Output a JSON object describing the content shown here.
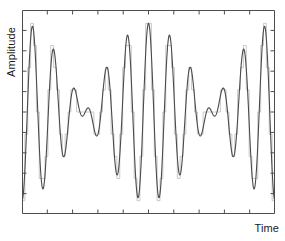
{
  "figure": {
    "background_color": "#ffffff",
    "width": 285,
    "height": 241
  },
  "axes": {
    "ylabel_text": "Amplitude",
    "xlabel_text": "Time",
    "frame_color": "#4d4d4d",
    "tick_color": "#4d4d4d",
    "x_tick_count": 9,
    "y_tick_count": 9,
    "tick_direction": "in",
    "tick_labels_visible": false,
    "grid": false
  },
  "series_style": {
    "analog_color": "#4a4a4a",
    "analog_width": 1.1,
    "quantized_color": "#c8c8c8",
    "quantized_width": 1.0
  },
  "chart_data": {
    "type": "line",
    "title": "",
    "xlabel": "Time",
    "ylabel": "Amplitude",
    "xlim": [
      0,
      1
    ],
    "ylim": [
      -1.15,
      1.15
    ],
    "grid": false,
    "legend_position": "none",
    "tick_labels": {
      "x": [],
      "y": []
    },
    "signal_model": {
      "formula": "y(t) = 0.5*sin(2*pi*f1*t) + 0.5*sin(2*pi*f2*t)",
      "f1_cycles_over_span": 13,
      "f2_cycles_over_span": 11,
      "phase1_deg": -90,
      "phase2_deg": -90,
      "amplitude1": 0.5,
      "amplitude2": 0.5
    },
    "sampling": {
      "sample_count": 88,
      "quantization_levels": 9,
      "quantization_step": 0.25,
      "hold": "zero-order"
    },
    "series": [
      {
        "name": "analog",
        "kind": "smooth",
        "color": "#4a4a4a",
        "points_hint": "evaluated from signal_model at 1400 samples"
      },
      {
        "name": "quantized",
        "kind": "staircase",
        "color": "#c8c8c8",
        "points_hint": "signal_model sampled at sampling.sample_count, rounded to quantization_step, zero-order hold"
      }
    ],
    "envelope_peaks_y": [
      1.0,
      0.55,
      1.0,
      0.55,
      1.0,
      0.55,
      1.0,
      0.55,
      1.0
    ],
    "envelope_troughs_y": [
      -1.0,
      -0.55,
      -1.0,
      -0.55,
      -1.0,
      -0.55,
      -1.0,
      -0.55
    ]
  }
}
